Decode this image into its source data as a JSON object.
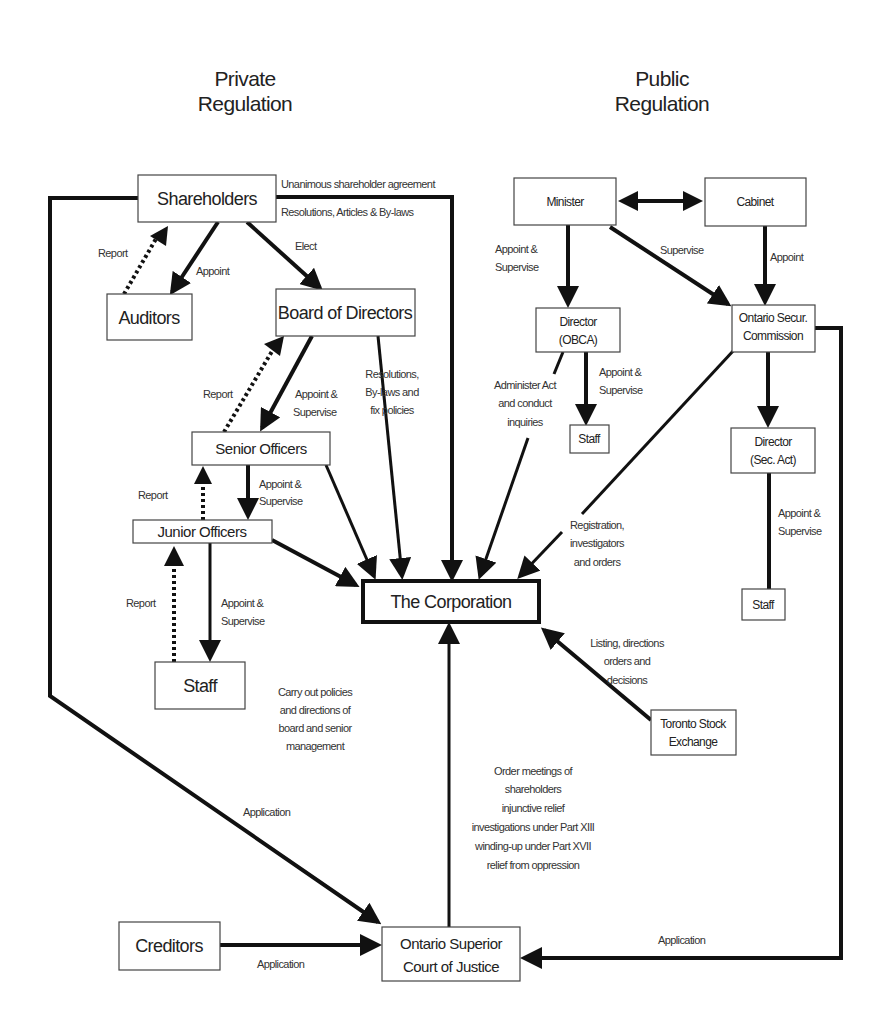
{
  "titles": {
    "private": [
      "Private",
      "Regulation"
    ],
    "public": [
      "Public",
      "Regulation"
    ]
  },
  "nodes": {
    "shareholders": "Shareholders",
    "auditors": "Auditors",
    "board": "Board of Directors",
    "senior_officers": "Senior Officers",
    "junior_officers": "Junior Officers",
    "staff_private": "Staff",
    "corporation": "The Corporation",
    "creditors": "Creditors",
    "court": [
      "Ontario Superior",
      "Court of Justice"
    ],
    "minister": "Minister",
    "cabinet": "Cabinet",
    "director_obca": [
      "Director",
      "(OBCA)"
    ],
    "staff_obca": "Staff",
    "osc": [
      "Ontario Secur.",
      "Commission"
    ],
    "director_sec": [
      "Director",
      "(Sec. Act)"
    ],
    "staff_sec": "Staff",
    "tse": [
      "Toronto Stock",
      "Exchange"
    ]
  },
  "labels": {
    "unanimous": "Unanimous shareholder agreement",
    "resolutions_articles": "Resolutions, Articles & By-laws",
    "report_auditors": "Report",
    "appoint_auditors": "Appoint",
    "elect": "Elect",
    "report_board": "Report",
    "appoint_supervise_board": [
      "Appoint &",
      "Supervise"
    ],
    "board_to_corp": [
      "Resolutions,",
      "By-laws and",
      "fix policies"
    ],
    "report_senior": "Report",
    "appoint_supervise_senior": [
      "Appoint &",
      "Supervise"
    ],
    "report_junior": "Report",
    "appoint_supervise_junior": [
      "Appoint &",
      "Supervise"
    ],
    "staff_duties": [
      "Carry out policies",
      "and directions of",
      "board and senior",
      "management"
    ],
    "application_shareholders": "Application",
    "application_creditors": "Application",
    "application_osc": "Application",
    "court_orders": [
      "Order meetings of",
      "shareholders",
      "injunctive relief",
      "investigations under Part XIII",
      "winding-up under Part XVII",
      "relief from oppression"
    ],
    "minister_appoint_supervise": [
      "Appoint &",
      "Supervise"
    ],
    "minister_supervise": "Supervise",
    "cabinet_appoint": "Appoint",
    "obca_administer": [
      "Administer Act",
      "and conduct",
      "inquiries"
    ],
    "obca_staff": [
      "Appoint &",
      "Supervise"
    ],
    "osc_registration": [
      "Registration,",
      "investigators",
      "and orders"
    ],
    "sec_staff": [
      "Appoint &",
      "Supervise"
    ],
    "tse_listing": [
      "Listing, directions",
      "orders and",
      "decisions"
    ]
  }
}
